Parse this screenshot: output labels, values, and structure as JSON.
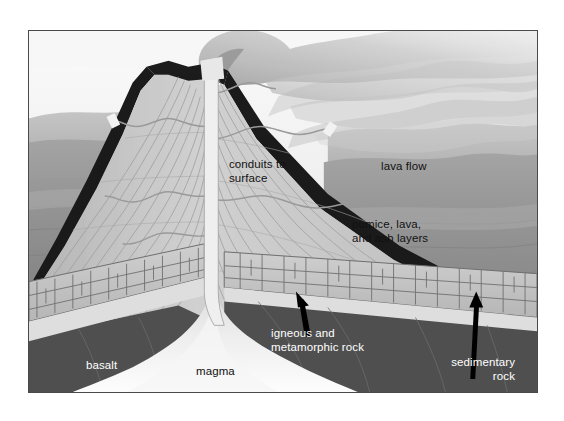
{
  "figure": {
    "kind": "volcano-cross-section-diagram",
    "frame": {
      "border_color": "#4a4a4a",
      "background_color": "#ffffff"
    }
  },
  "labels": {
    "conduits": "conduits to\nsurface",
    "lava_flow": "lava flow",
    "pumice": "pumice, lava,\nand ash layers",
    "igneous": "igneous and\nmetamorphic rock",
    "sedimentary": "sedimentary\nrock",
    "basalt": "basalt",
    "magma": "magma"
  },
  "colors": {
    "sky_top": "#f2f2f2",
    "sky_haze": "#d8d8d8",
    "hills_far": "#b9b9b9",
    "hills_mid": "#9e9e9e",
    "plain_near": "#8e8e8e",
    "cone_body": "#c9c9c9",
    "cone_shade": "#bcbcbc",
    "lava_cap": "#1e1e1e",
    "conduit_fill": "#efefef",
    "magma_fill": "#f0f0f0",
    "basalt_dark": "#4e4e4e",
    "sediment_band": "#c4c4c4",
    "sediment_line": "#6b6b6b",
    "smoke": "#bdbdbd",
    "arrow": "#000000",
    "text_dark": "#111111",
    "text_light": "#ffffff"
  },
  "arrows": [
    {
      "name": "arrow-igneous",
      "points_to": "igneous and metamorphic rock layer",
      "direction": "up-left"
    },
    {
      "name": "arrow-sedimentary",
      "points_to": "sedimentary rock band",
      "direction": "up"
    }
  ]
}
